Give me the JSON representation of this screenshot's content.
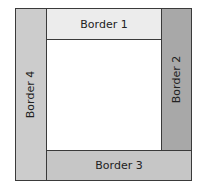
{
  "diagram": {
    "borders": [
      {
        "id": 1,
        "label": "Border 1",
        "position": "top",
        "color": "#ececec"
      },
      {
        "id": 2,
        "label": "Border 2",
        "position": "right",
        "color": "#a8a8a8"
      },
      {
        "id": 3,
        "label": "Border 3",
        "position": "bottom",
        "color": "#c6c6c6"
      },
      {
        "id": 4,
        "label": "Border 4",
        "position": "left",
        "color": "#cccccc"
      }
    ],
    "center_color": "#ffffff",
    "outline_color": "#3a3a3a"
  }
}
